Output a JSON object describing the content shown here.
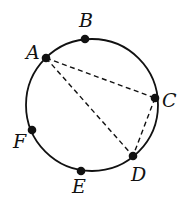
{
  "diagram": {
    "circle": {
      "cx": 92,
      "cy": 105,
      "r": 66
    },
    "points": [
      {
        "id": "A",
        "label": "A",
        "x": 46,
        "y": 58,
        "lx": 26,
        "ly": 59
      },
      {
        "id": "B",
        "label": "B",
        "x": 85,
        "y": 39,
        "lx": 79,
        "ly": 27
      },
      {
        "id": "C",
        "label": "C",
        "x": 155,
        "y": 98,
        "lx": 162,
        "ly": 107
      },
      {
        "id": "D",
        "label": "D",
        "x": 133,
        "y": 156,
        "lx": 131,
        "ly": 181
      },
      {
        "id": "E",
        "label": "E",
        "x": 81,
        "y": 171,
        "lx": 72,
        "ly": 193
      },
      {
        "id": "F",
        "label": "F",
        "x": 32,
        "y": 130,
        "lx": 13,
        "ly": 148
      }
    ],
    "dashed_segments": [
      {
        "from": "A",
        "to": "C"
      },
      {
        "from": "A",
        "to": "D"
      },
      {
        "from": "C",
        "to": "D"
      }
    ],
    "colors": {
      "stroke": "#111111",
      "point": "#111111",
      "background": "#ffffff"
    }
  }
}
